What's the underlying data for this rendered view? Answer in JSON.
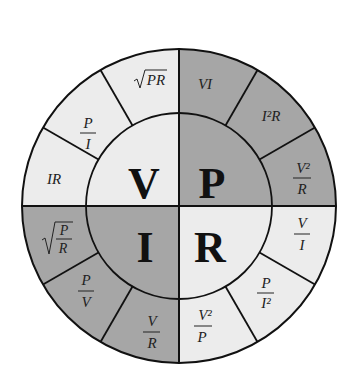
{
  "diagram": {
    "colors": {
      "dark_fill": "#a6a6a6",
      "light_fill": "#ececec",
      "line": "#111111",
      "background": "#ffffff"
    },
    "quadrants": [
      {
        "symbol": "V",
        "position": "top-left",
        "shade": "light",
        "formulas": [
          {
            "id": "v-ir",
            "type": "text",
            "text": "IR"
          },
          {
            "id": "v-p-over-i",
            "type": "fraction",
            "num": "P",
            "den": "I"
          },
          {
            "id": "v-sqrt-pr",
            "type": "sqrt",
            "text": "PR"
          }
        ]
      },
      {
        "symbol": "P",
        "position": "top-right",
        "shade": "dark",
        "formulas": [
          {
            "id": "p-vi",
            "type": "text",
            "text": "VI"
          },
          {
            "id": "p-i2r",
            "type": "text",
            "text": "I²R"
          },
          {
            "id": "p-v2-over-r",
            "type": "fraction",
            "num": "V²",
            "den": "R"
          }
        ]
      },
      {
        "symbol": "R",
        "position": "bottom-right",
        "shade": "light",
        "formulas": [
          {
            "id": "r-v-over-i",
            "type": "fraction",
            "num": "V",
            "den": "I"
          },
          {
            "id": "r-p-over-i2",
            "type": "fraction",
            "num": "P",
            "den": "I²"
          },
          {
            "id": "r-v2-over-p",
            "type": "fraction",
            "num": "V²",
            "den": "P"
          }
        ]
      },
      {
        "symbol": "I",
        "position": "bottom-left",
        "shade": "dark",
        "formulas": [
          {
            "id": "i-v-over-r",
            "type": "fraction",
            "num": "V",
            "den": "R"
          },
          {
            "id": "i-p-over-v",
            "type": "fraction",
            "num": "P",
            "den": "V"
          },
          {
            "id": "i-sqrt-p-over-r",
            "type": "sqrt-fraction",
            "num": "P",
            "den": "R"
          }
        ]
      }
    ]
  }
}
